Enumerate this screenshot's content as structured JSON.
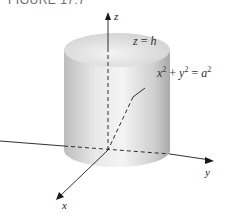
{
  "figure": {
    "caption": "FIGURE 17.7",
    "axes": {
      "x_label": "x",
      "y_label": "y",
      "z_label": "z"
    },
    "annotations": {
      "top_plane": "z = h",
      "cylinder_equation": "x² + y² = a²"
    },
    "colors": {
      "cylinder_light": "#f2f2f2",
      "cylinder_dark": "#a8a8a8",
      "axis": "#1a1a1a"
    }
  }
}
